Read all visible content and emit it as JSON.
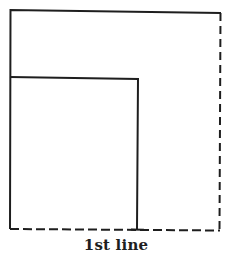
{
  "diagram": {
    "caption": "1st line",
    "colors": {
      "stroke": "#1e1e1e",
      "background": "#ffffff"
    },
    "shapes": {
      "outer_box": {
        "solid_edges": [
          "top",
          "left"
        ],
        "dashed_edges": [
          "right",
          "bottom"
        ]
      },
      "inner_box": {
        "solid_edges": [
          "top",
          "left",
          "right"
        ],
        "dashed_edges": [
          "bottom"
        ]
      }
    }
  }
}
